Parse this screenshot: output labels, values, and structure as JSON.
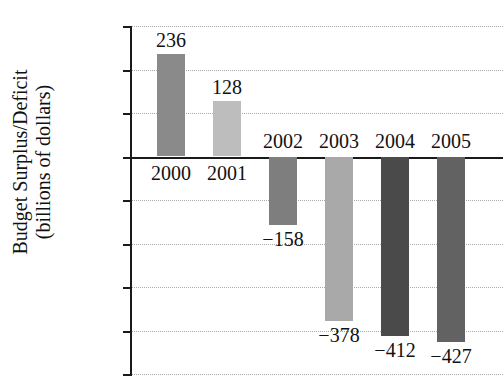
{
  "chart_data": {
    "type": "bar",
    "title": "",
    "xlabel": "",
    "ylabel_line1": "Budget Surplus/Deficit",
    "ylabel_line2": "(billions of dollars)",
    "categories": [
      "2000",
      "2001",
      "2002",
      "2003",
      "2004",
      "2005"
    ],
    "values": [
      236,
      128,
      -158,
      -378,
      -412,
      -427
    ],
    "value_labels": [
      "236",
      "128",
      "−158",
      "−378",
      "−412",
      "−427"
    ],
    "ylim": [
      -500,
      300
    ],
    "ytick_values": [
      300,
      200,
      100,
      0,
      -100,
      -200,
      -300,
      -400,
      -500
    ],
    "ytick_labels": [
      "300",
      "200",
      "100",
      "0",
      "−100",
      "−200",
      "−300",
      "−400",
      "−500"
    ],
    "grid": true,
    "legend": "none",
    "bar_colors": [
      "#8a8a8a",
      "#bdbdbd",
      "#7e7e7e",
      "#a9a9a9",
      "#4a4a4a",
      "#626262"
    ],
    "axis_color": "#1a1a1a",
    "grid_color": "#a9a9a9",
    "background": "#ffffff"
  }
}
